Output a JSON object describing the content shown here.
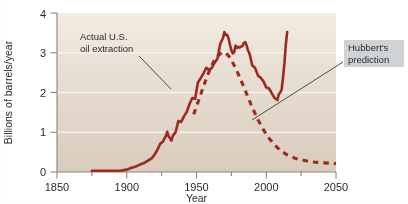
{
  "chart_data": {
    "type": "line",
    "title": "",
    "xlabel": "Year",
    "ylabel": "Billions of barrels/year",
    "xlim": [
      1850,
      2050
    ],
    "ylim": [
      0,
      4
    ],
    "xticks": [
      1850,
      1900,
      1950,
      2000,
      2050
    ],
    "xtick_labels": [
      "1850",
      "1900",
      "1950",
      "2000",
      "2050"
    ],
    "xminor_ticks": [
      1875,
      1925,
      1975,
      2025
    ],
    "yticks": [
      0,
      1,
      2,
      3,
      4
    ],
    "ytick_labels": [
      "0",
      "1",
      "2",
      "3",
      "4"
    ],
    "grid": "horizontal-white-at-1-2-3",
    "legend": "none (inline annotations)",
    "series": [
      {
        "name": "Actual U.S. oil extraction",
        "style": "solid",
        "color": "#9d2a20",
        "x": [
          1875,
          1880,
          1885,
          1890,
          1895,
          1900,
          1903,
          1906,
          1909,
          1912,
          1915,
          1918,
          1920,
          1922,
          1924,
          1926,
          1928,
          1929,
          1930,
          1931,
          1932,
          1933,
          1935,
          1937,
          1939,
          1941,
          1943,
          1945,
          1947,
          1949,
          1951,
          1953,
          1955,
          1957,
          1959,
          1961,
          1963,
          1965,
          1967,
          1969,
          1970,
          1971,
          1972,
          1973,
          1974,
          1975,
          1976,
          1977,
          1978,
          1979,
          1980,
          1981,
          1982,
          1983,
          1984,
          1985,
          1986,
          1987,
          1988,
          1990,
          1992,
          1994,
          1996,
          1998,
          2000,
          2002,
          2004,
          2006,
          2008,
          2009,
          2010,
          2011,
          2012,
          2013,
          2014,
          2015
        ],
        "y": [
          0.03,
          0.03,
          0.03,
          0.03,
          0.03,
          0.06,
          0.1,
          0.13,
          0.18,
          0.22,
          0.28,
          0.35,
          0.44,
          0.56,
          0.71,
          0.77,
          0.9,
          1.01,
          0.9,
          0.85,
          0.79,
          0.91,
          1.0,
          1.28,
          1.26,
          1.4,
          1.51,
          1.71,
          1.86,
          1.84,
          2.25,
          2.36,
          2.48,
          2.62,
          2.57,
          2.62,
          2.75,
          2.85,
          3.22,
          3.37,
          3.52,
          3.45,
          3.45,
          3.36,
          3.2,
          3.06,
          2.98,
          3.01,
          3.18,
          3.12,
          3.15,
          3.13,
          3.16,
          3.17,
          3.25,
          3.27,
          3.17,
          3.05,
          2.98,
          2.68,
          2.62,
          2.43,
          2.37,
          2.28,
          2.13,
          2.1,
          1.98,
          1.86,
          1.81,
          1.96,
          2.0,
          2.07,
          2.37,
          2.72,
          3.2,
          3.52
        ]
      },
      {
        "name": "Hubbert's prediction",
        "style": "dashed",
        "color": "#9d2a20",
        "x": [
          1948,
          1952,
          1956,
          1960,
          1964,
          1968,
          1971,
          1974,
          1978,
          1982,
          1986,
          1990,
          1994,
          1998,
          2002,
          2006,
          2010,
          2014,
          2018,
          2022,
          2026,
          2030,
          2034,
          2038,
          2042,
          2046,
          2050
        ],
        "y": [
          1.45,
          1.85,
          2.25,
          2.62,
          2.88,
          3.0,
          3.0,
          2.88,
          2.62,
          2.3,
          1.96,
          1.62,
          1.32,
          1.06,
          0.85,
          0.68,
          0.55,
          0.45,
          0.38,
          0.33,
          0.3,
          0.27,
          0.25,
          0.24,
          0.23,
          0.22,
          0.21
        ]
      }
    ],
    "annotations": [
      {
        "name": "actual-extraction-annotation",
        "text_line1": "Actual U.S.",
        "text_line2": "oil extraction",
        "points_to": "solid curve rising limb near 1945"
      },
      {
        "name": "hubbert-prediction-annotation",
        "text_line1": "Hubbert's",
        "text_line2": "prediction",
        "points_to": "dashed curve near 2005"
      }
    ]
  },
  "colors": {
    "curve": "#9d2a20",
    "plot_bg_top": "#f1ebe0",
    "plot_bg_bottom": "#dbcfc0",
    "gridline": "#f7f3ec",
    "axis": "#8d8379",
    "text": "#2b2b2b",
    "callout_bg": "#cfd3d6"
  }
}
